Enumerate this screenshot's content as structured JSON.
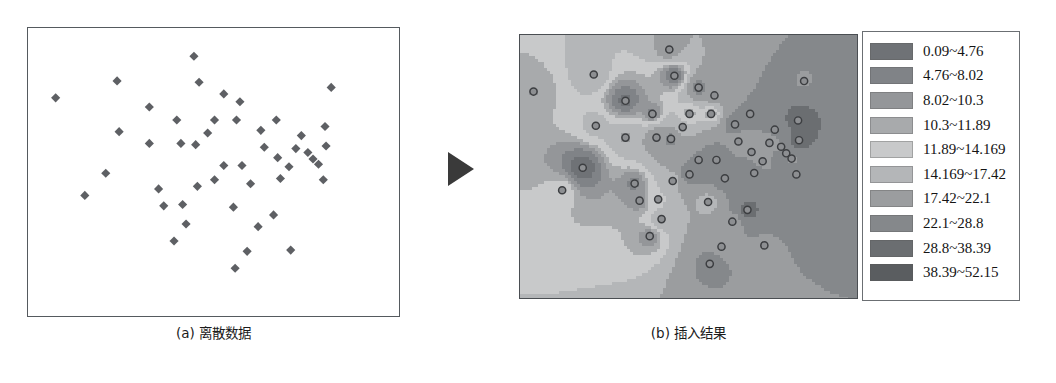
{
  "figure": {
    "panel_a": {
      "caption": "(a) 离散数据",
      "marker_color": "#5e6064",
      "border_color": "#555a5e",
      "background": "#ffffff"
    },
    "panel_b": {
      "caption": "(b) 插入结果",
      "border_color": "#4a4e52",
      "sample_point_fill": "#8d8f92",
      "sample_point_stroke": "#3c3e41"
    },
    "arrow": {
      "name": "right-arrow",
      "color": "#3a3a3a"
    }
  },
  "legend": {
    "title": "",
    "rows": [
      {
        "label": "0.09~4.76",
        "color": "#6f7276",
        "min": 0.09,
        "max": 4.76
      },
      {
        "label": "4.76~8.02",
        "color": "#808387",
        "min": 4.76,
        "max": 8.02
      },
      {
        "label": "8.02~10.3",
        "color": "#949699",
        "min": 8.02,
        "max": 10.3
      },
      {
        "label": "10.3~11.89",
        "color": "#a8aaac",
        "min": 10.3,
        "max": 11.89
      },
      {
        "label": "11.89~14.169",
        "color": "#c8c9ca",
        "min": 11.89,
        "max": 14.169
      },
      {
        "label": "14.169~17.42",
        "color": "#b4b6b8",
        "min": 14.169,
        "max": 17.42
      },
      {
        "label": "17.42~22.1",
        "color": "#9b9d9f",
        "min": 17.42,
        "max": 22.1
      },
      {
        "label": "22.1~28.8",
        "color": "#85888b",
        "min": 22.1,
        "max": 28.8
      },
      {
        "label": "28.8~38.39",
        "color": "#6b6e71",
        "min": 28.8,
        "max": 38.39
      },
      {
        "label": "38.39~52.15",
        "color": "#5a5d60",
        "min": 38.39,
        "max": 52.15
      }
    ]
  },
  "chart_data": {
    "type": "scatter",
    "title": "",
    "xlabel": "",
    "ylabel": "",
    "xlim": [
      0,
      100
    ],
    "ylim": [
      0,
      100
    ],
    "grid": false,
    "legend_position": "right-of-raster",
    "series": [
      {
        "name": "discrete sample points",
        "points": [
          [
            4.0,
            78.5
          ],
          [
            21.9,
            85.0
          ],
          [
            44.3,
            94.5
          ],
          [
            45.8,
            84.5
          ],
          [
            53.0,
            80.0
          ],
          [
            57.7,
            77.0
          ],
          [
            84.3,
            82.5
          ],
          [
            31.3,
            75.0
          ],
          [
            39.3,
            70.0
          ],
          [
            50.3,
            70.0
          ],
          [
            56.7,
            70.0
          ],
          [
            68.3,
            70.0
          ],
          [
            82.5,
            67.5
          ],
          [
            22.5,
            65.5
          ],
          [
            63.8,
            66.0
          ],
          [
            48.3,
            65.0
          ],
          [
            75.6,
            64.0
          ],
          [
            31.3,
            61.0
          ],
          [
            40.5,
            61.0
          ],
          [
            44.8,
            60.5
          ],
          [
            64.8,
            59.5
          ],
          [
            74.0,
            59.0
          ],
          [
            77.5,
            57.5
          ],
          [
            82.8,
            60.0
          ],
          [
            68.7,
            55.5
          ],
          [
            79.0,
            55.0
          ],
          [
            80.6,
            53.0
          ],
          [
            53.0,
            52.5
          ],
          [
            58.3,
            52.5
          ],
          [
            72.0,
            52.0
          ],
          [
            18.6,
            49.5
          ],
          [
            45.3,
            44.5
          ],
          [
            50.3,
            47.0
          ],
          [
            60.8,
            45.5
          ],
          [
            69.5,
            47.5
          ],
          [
            82.0,
            47.0
          ],
          [
            12.5,
            41.0
          ],
          [
            34.0,
            43.5
          ],
          [
            35.5,
            37.0
          ],
          [
            41.0,
            37.5
          ],
          [
            42.0,
            30.0
          ],
          [
            55.8,
            36.5
          ],
          [
            67.5,
            33.5
          ],
          [
            63.0,
            29.0
          ],
          [
            38.5,
            23.5
          ],
          [
            59.8,
            19.5
          ],
          [
            72.5,
            20.0
          ],
          [
            56.3,
            13.0
          ]
        ]
      }
    ],
    "interpolated_surface": {
      "note": "contour-filled raster of the same sample field, 10 class breaks",
      "class_breaks": [
        0.09,
        4.76,
        8.02,
        10.3,
        11.89,
        14.169,
        17.42,
        22.1,
        28.8,
        38.39,
        52.15
      ]
    }
  }
}
